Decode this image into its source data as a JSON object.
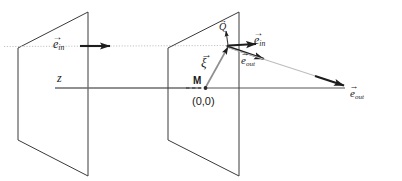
{
  "figure": {
    "kind": "scattering-geometry-diagram",
    "background": "#ffffff",
    "stroke_dark": "#2b2b2b",
    "stroke_light": "#b8b8b8",
    "stroke_mid": "#6f6f6f",
    "width": 402,
    "height": 181
  },
  "labels": {
    "axis_z": "z",
    "e_in_left": {
      "symbol": "e",
      "sub": "in",
      "accent": "→"
    },
    "e_in_right": {
      "symbol": "e",
      "sub": "in",
      "accent": "→"
    },
    "e_out_near": {
      "symbol": "e",
      "sub": "out",
      "accent": "→"
    },
    "e_out_far": {
      "symbol": "e",
      "sub": "out",
      "accent": "→"
    },
    "xi": {
      "symbol": "ξ",
      "sub": "",
      "accent": "→"
    },
    "q_point": {
      "symbol": "Q",
      "sub": "",
      "accent": "→"
    },
    "m_point": "M",
    "origin": "(0,0)"
  },
  "geometry": {
    "plane_left": {
      "tr": [
        88,
        12
      ],
      "tl": [
        18,
        48
      ],
      "bl": [
        18,
        140
      ],
      "br": [
        88,
        176
      ]
    },
    "plane_right": {
      "tr": [
        239,
        12
      ],
      "tl": [
        168,
        48
      ],
      "bl": [
        168,
        140
      ],
      "br": [
        239,
        176
      ]
    },
    "z_axis": {
      "x1": 55,
      "y1": 88,
      "x2": 345,
      "y2": 88
    },
    "scatter_point": [
      228,
      46
    ],
    "origin_point": [
      205,
      88
    ],
    "e_in_left_arrow": {
      "x1": 80,
      "y1": 46,
      "x2": 112,
      "y2": 46
    },
    "e_in_right_arrow": {
      "x1": 228,
      "y1": 46,
      "x2": 258,
      "y2": 44
    },
    "e_out_near_arrow": {
      "x1": 228,
      "y1": 47,
      "x2": 268,
      "y2": 60
    },
    "e_out_far_arrow": {
      "x1": 228,
      "y1": 48,
      "x2": 344,
      "y2": 85
    },
    "xi_arrow": {
      "x1": 205,
      "y1": 88,
      "x2": 228,
      "y2": 46
    },
    "q_arrow": {
      "x1": 228,
      "y1": 46,
      "x2": 225,
      "y2": 28
    },
    "dotted_ray": {
      "x1": 5,
      "y1": 46,
      "x2": 228,
      "y2": 46
    }
  }
}
